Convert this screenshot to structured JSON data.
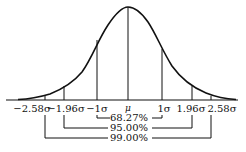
{
  "labels": {
    "neg258": "−2.58σ",
    "neg196": "−1.96σ",
    "neg1": "−1σ",
    "mu": "μ",
    "pos1": "1σ",
    "pos196": "1.96σ",
    "pos258": "2.58σ"
  },
  "intervals": {
    "p6827": "68.27%",
    "p9500": "95.00%",
    "p9900": "99.00%"
  },
  "colors": {
    "line": "#111111",
    "background": "#ffffff"
  }
}
